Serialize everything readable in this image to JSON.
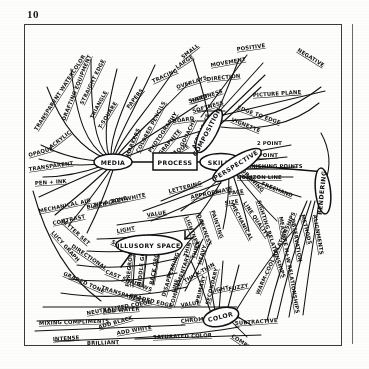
{
  "page": {
    "number": "10"
  },
  "diagram": {
    "ink_color": "#111111",
    "paper_color": "#fdfdfb",
    "nodes": [
      {
        "id": "media",
        "label": "MEDIA",
        "shape": "ellipse"
      },
      {
        "id": "process",
        "label": "PROCESS",
        "shape": "rectangle"
      },
      {
        "id": "skills",
        "label": "SKILLS",
        "shape": "ellipse"
      },
      {
        "id": "composition",
        "label": "COMPOSITION",
        "shape": "ellipse"
      },
      {
        "id": "perspective",
        "label": "PERSPECTIVE",
        "shape": "ellipse"
      },
      {
        "id": "rendering",
        "label": "RENDERING",
        "shape": "ellipse"
      },
      {
        "id": "illusory",
        "label": "ILLUSORY SPACE",
        "shape": "ellipse"
      },
      {
        "id": "color",
        "label": "COLOR",
        "shape": "ellipse"
      }
    ],
    "branches": {
      "media": [
        "TRANSPARENT WATERCOLOR",
        "DRAFTING EQUIPMENT",
        "STRAIGHT EDGE",
        "TRIANGLE",
        "T-SQUARE",
        "PAPERS",
        "TRACING",
        "OVERLAYS",
        "MARKERS",
        "COLORED PENCILS",
        "PHOTOGRAPHY",
        "GRAPHITE",
        "HARDNESS",
        "SOFTNESS",
        "OPAQUE",
        "GOUACHE",
        "ACRYLIC",
        "ACRYLIC ",
        "OPAQUE ",
        "TRANSPARENT",
        "PEN + INK",
        "MECHANICAL AID",
        "ZIP A TONE",
        "LETTER SET",
        "LUCY GRAPH"
      ],
      "composition": [
        "SPACE",
        "SMALL",
        "LARGE",
        "POSITIVE",
        "NEGATIVE",
        "MOVEMENT",
        "DIRECTION",
        "SHEET",
        "BOARD",
        "PICTURE PLANE",
        "EDGE TO EDGE",
        "VIGNETTE"
      ],
      "perspective": [
        "2 POINT",
        "1 POINT",
        "VANISHING POINTS",
        "HORIZON LINE"
      ],
      "skills": [
        "LETTERING",
        "APPROPRIATE",
        "FACE",
        "SIZE",
        "DRAWING",
        "FREEHAND",
        "LINE QUALITY",
        "MECHANICAL",
        "PAINTING",
        "VALUE",
        "DARKNESS",
        "LIGHTNESS"
      ],
      "rendering": [
        "METHODS",
        "ALIGNMENTS",
        "OBSERVATION",
        "MEASURE H+W RELATIONSHIPS",
        "SIGHTING RELATIONSHIPS"
      ],
      "value": [
        "BLACK-GREY-WHITE",
        "CONTRAST",
        "DIRECTIONAL",
        "LIGHT",
        "SHADOW",
        "GRADED TONE",
        "CAST SHADOWS",
        "TRANSPARENT",
        "GRADED EDGE",
        "VALUE"
      ],
      "line": [
        "DISAPPEARING",
        "LINE",
        "THIN",
        "THICK",
        "HEAVY",
        "THICK-THIN",
        "LIGHT",
        "FUZZY"
      ],
      "illusory_space": [
        "FOREGROUND",
        "MIDDLE GROUND",
        "BACK GROUND"
      ],
      "color": [
        "PRIMARY",
        "SECONDARY",
        "COMPLEMENTARY",
        "WARM-COOL RELATIONSHIPS",
        "SUBTRACTIVE",
        "COMPLEMENTARY "
      ],
      "color_bottom": [
        "VALUE / COLOR CONTRAST",
        "ADD WATER",
        "MIXING COMPLIMENTS",
        "NEUTRALIZED COLOR",
        "ADD BLACK",
        "ADD WHITE",
        "CHROMATIC GREYS",
        "INTENSE",
        "BRILLIANT",
        "SATURATED COLOR"
      ]
    }
  }
}
